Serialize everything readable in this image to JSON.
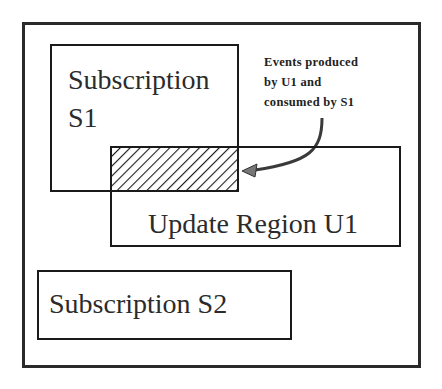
{
  "diagram": {
    "type": "region-overlap",
    "outer_frame": {
      "x": 22,
      "y": 22,
      "w": 399,
      "h": 346
    },
    "subscription_s1": {
      "label_line1": "Subscription",
      "label_line2": "S1",
      "x": 50,
      "y": 44,
      "w": 189,
      "h": 148
    },
    "update_region_u1": {
      "label": "Update Region U1",
      "x": 110,
      "y": 146,
      "w": 291,
      "h": 101
    },
    "overlap": {
      "x": 111,
      "y": 147,
      "w": 127,
      "h": 45,
      "fill": "diagonal-hatch"
    },
    "subscription_s2": {
      "label": "Subscription S2",
      "x": 37,
      "y": 270,
      "w": 255,
      "h": 70
    },
    "annotation": {
      "lines": [
        "Events produced",
        "by U1 and",
        "consumed by S1"
      ],
      "arrow": "curved arrow from annotation to overlap region"
    },
    "colors": {
      "stroke": "#1a1a1a",
      "text": "#2b2b2b",
      "arrow": "#555555",
      "background": "#ffffff"
    }
  }
}
